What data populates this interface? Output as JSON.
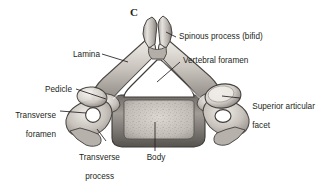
{
  "figure": {
    "panel_letter": "C",
    "background_color": "#ffffff",
    "text_color": "#231f20",
    "leader_line_color": "#231f20",
    "bone_outline_color": "#4a4646",
    "bone_fill_light": "#e9e6e2",
    "bone_fill_mid": "#b9b4ae",
    "bone_fill_dark": "#7d7873",
    "foramen_fill": "#ffffff",
    "body_fill": "#cfcac3"
  },
  "labels": {
    "spinous_process": "Spinous process (bifid)",
    "vertebral_foramen": "Vertebral foramen",
    "lamina": "Lamina",
    "pedicle": "Pedicle",
    "transverse_foramen_line1": "Transverse",
    "transverse_foramen_line2": "foramen",
    "superior_articular_line1": "Superior articular",
    "superior_articular_line2": "facet",
    "transverse_process_line1": "Transverse",
    "transverse_process_line2": "process",
    "body": "Body"
  }
}
